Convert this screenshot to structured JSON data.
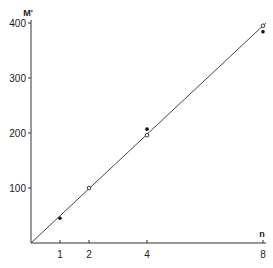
{
  "chart_data": {
    "type": "scatter",
    "title": "",
    "xlabel": "n",
    "ylabel": "M'",
    "xlim": [
      0,
      8
    ],
    "ylim": [
      0,
      400
    ],
    "grid": false,
    "legend": null,
    "x_ticks": [
      {
        "value": 1,
        "label": "1"
      },
      {
        "value": 2,
        "label": "2"
      },
      {
        "value": 4,
        "label": "4"
      },
      {
        "value": 8,
        "label": "8"
      }
    ],
    "y_ticks": [
      {
        "value": 100,
        "label": "100"
      },
      {
        "value": 200,
        "label": "200"
      },
      {
        "value": 300,
        "label": "300"
      },
      {
        "value": 400,
        "label": "400"
      }
    ],
    "series": [
      {
        "name": "measured (filled)",
        "marker": "filled-dot",
        "points": [
          {
            "x": 1,
            "y": 45
          },
          {
            "x": 4,
            "y": 207
          },
          {
            "x": 8,
            "y": 384
          }
        ]
      },
      {
        "name": "measured (open)",
        "marker": "open-circle",
        "points": [
          {
            "x": 2,
            "y": 100
          },
          {
            "x": 4,
            "y": 196
          },
          {
            "x": 8,
            "y": 395
          }
        ]
      },
      {
        "name": "fit line",
        "marker": "line",
        "points": [
          {
            "x": 0,
            "y": 0
          },
          {
            "x": 8.1,
            "y": 400
          }
        ]
      }
    ]
  }
}
